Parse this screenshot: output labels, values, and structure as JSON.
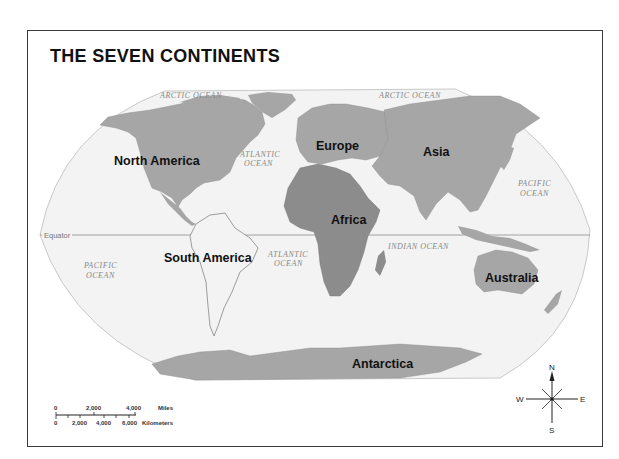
{
  "title": "THE SEVEN CONTINENTS",
  "continents": {
    "north_america": "North America",
    "south_america": "South America",
    "europe": "Europe",
    "asia": "Asia",
    "africa": "Africa",
    "australia": "Australia",
    "antarctica": "Antarctica"
  },
  "oceans": {
    "arctic_west": "ARCTIC OCEAN",
    "arctic_east": "ARCTIC OCEAN",
    "atlantic_north_1": "ATLANTIC",
    "atlantic_north_2": "OCEAN",
    "atlantic_south_1": "ATLANTIC",
    "atlantic_south_2": "OCEAN",
    "pacific_west_1": "PACIFIC",
    "pacific_west_2": "OCEAN",
    "pacific_east_1": "PACIFIC",
    "pacific_east_2": "OCEAN",
    "indian": "INDIAN OCEAN"
  },
  "equator_label": "Equator",
  "scale_bar": {
    "miles_ticks": [
      "0",
      "2,000",
      "4,000"
    ],
    "miles_unit": "Miles",
    "km_ticks": [
      "0",
      "2,000",
      "4,000",
      "6,000"
    ],
    "km_unit": "Kilometers"
  },
  "compass": {
    "n": "N",
    "s": "S",
    "e": "E",
    "w": "W"
  },
  "colors": {
    "land_light": "#a6a6a6",
    "land_africa": "#8c8c8c",
    "ocean": "#f3f3f3",
    "frame": "#3a3a3a"
  }
}
